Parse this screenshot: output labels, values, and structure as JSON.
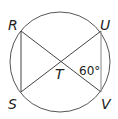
{
  "diagram": {
    "points": [
      {
        "name": "R",
        "x": 21,
        "y": 31
      },
      {
        "name": "U",
        "x": 101,
        "y": 31
      },
      {
        "name": "S",
        "x": 21,
        "y": 93
      },
      {
        "name": "V",
        "x": 101,
        "y": 93
      },
      {
        "name": "T",
        "x": 61,
        "y": 62
      }
    ],
    "segments": [
      "RV",
      "US",
      "RS",
      "UV"
    ],
    "circle": {
      "cx": 61,
      "cy": 62,
      "r": 50
    },
    "labels": {
      "R": "R",
      "U": "U",
      "S": "S",
      "V": "V",
      "T": "T"
    },
    "angle_label": "60°"
  }
}
